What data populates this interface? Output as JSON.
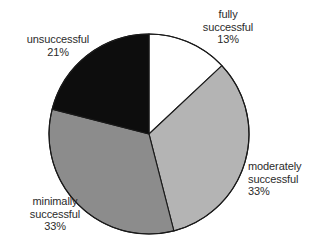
{
  "chart_data": {
    "type": "pie",
    "title": "",
    "subtitle": "",
    "xlabel": "",
    "ylabel": "",
    "legend_position": "none",
    "grid": false,
    "start_angle_deg": 0,
    "direction": "clockwise",
    "units": "percent",
    "categories": [
      "fully successful",
      "moderately successful",
      "minimally successful",
      "unsuccessful"
    ],
    "values": [
      13,
      33,
      33,
      21
    ],
    "value_labels": [
      "13%",
      "33%",
      "33%",
      "21%"
    ],
    "colors": [
      "#ffffff",
      "#b4b4b4",
      "#8c8c8c",
      "#0d0d0d"
    ],
    "slices": [
      {
        "label": "fully successful",
        "label_line1": "fully",
        "label_line2": "successful",
        "value": 13,
        "value_label": "13%",
        "color": "#ffffff",
        "start_deg": 0,
        "end_deg": 46.8
      },
      {
        "label": "moderately successful",
        "label_line1": "moderately",
        "label_line2": "successful",
        "value": 33,
        "value_label": "33%",
        "color": "#b4b4b4",
        "start_deg": 46.8,
        "end_deg": 165.6
      },
      {
        "label": "minimally successful",
        "label_line1": "minimally",
        "label_line2": "successful",
        "value": 33,
        "value_label": "33%",
        "color": "#8c8c8c",
        "start_deg": 165.6,
        "end_deg": 284.4
      },
      {
        "label": "unsuccessful",
        "label_line1": "unsuccessful",
        "label_line2": "",
        "value": 21,
        "value_label": "21%",
        "color": "#0d0d0d",
        "start_deg": 284.4,
        "end_deg": 360
      }
    ]
  },
  "style": {
    "background": "#ffffff",
    "stroke": "#1a1a1a",
    "text": "#2b2b2b"
  },
  "geometry": {
    "cx": 149,
    "cy": 134,
    "r": 100
  }
}
